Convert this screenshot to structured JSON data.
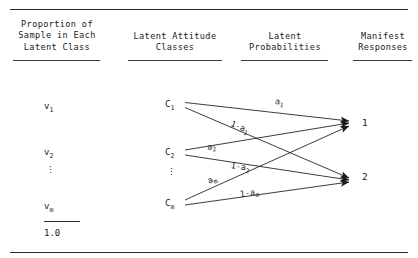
{
  "headers": [
    {
      "id": "proportion",
      "text": "Proportion of\nSample in Each\nLatent Class"
    },
    {
      "id": "latent-classes",
      "text": "Latent Attitude\nClasses"
    },
    {
      "id": "latent-probabilities",
      "text": "Latent\nProbabilities"
    },
    {
      "id": "manifest-responses",
      "text": "Manifest\nResponses"
    }
  ],
  "proportions": {
    "items": [
      {
        "base": "v",
        "sub": "1"
      },
      {
        "base": "v",
        "sub": "2"
      },
      {
        "base": "v",
        "sub": "m"
      }
    ],
    "ellipsis": "⋮",
    "total": "1.0"
  },
  "classes": {
    "items": [
      {
        "base": "C",
        "sub": "1"
      },
      {
        "base": "C",
        "sub": "2"
      },
      {
        "base": "C",
        "sub": "m"
      }
    ],
    "ellipsis": "⋮"
  },
  "edge_labels": [
    {
      "id": "a1",
      "base": "a",
      "sub": "1"
    },
    {
      "id": "1-a1",
      "base": "1-a",
      "sub": "1"
    },
    {
      "id": "a2",
      "base": "a",
      "sub": "2"
    },
    {
      "id": "1-a2",
      "base": "1-a",
      "sub": "2"
    },
    {
      "id": "am",
      "base": "a",
      "sub": "m"
    },
    {
      "id": "1-am",
      "base": "1-a",
      "sub": "m"
    }
  ],
  "responses": [
    {
      "id": "response-1",
      "label": "1"
    },
    {
      "id": "response-2",
      "label": "2"
    }
  ],
  "colors": {
    "ink": "#1a1a1a",
    "rule": "#2b2b2b",
    "background": "#ffffff"
  }
}
